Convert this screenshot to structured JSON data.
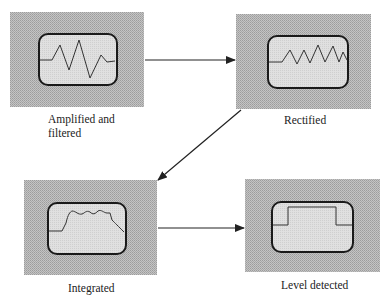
{
  "diagram": {
    "type": "signal-processing-flow",
    "stages": [
      {
        "id": 1,
        "label_line1": "Amplified and",
        "label_line2": "filtered",
        "waveform": "oscillating-burst"
      },
      {
        "id": 2,
        "label_line1": "Rectified",
        "label_line2": "",
        "waveform": "rectified-burst"
      },
      {
        "id": 3,
        "label_line1": "Integrated",
        "label_line2": "",
        "waveform": "integrated-envelope"
      },
      {
        "id": 4,
        "label_line1": "Level detected",
        "label_line2": "",
        "waveform": "square-pulse"
      }
    ],
    "arrows": [
      {
        "from": 1,
        "to": 2,
        "direction": "right"
      },
      {
        "from": 2,
        "to": 3,
        "direction": "down-left"
      },
      {
        "from": 3,
        "to": 4,
        "direction": "right"
      }
    ],
    "colors": {
      "panel_fill": "#b8b8b8",
      "screen_fill": "#d8d8d8",
      "screen_border": "#1a1a1a",
      "trace": "#333333",
      "arrow": "#222222"
    }
  }
}
